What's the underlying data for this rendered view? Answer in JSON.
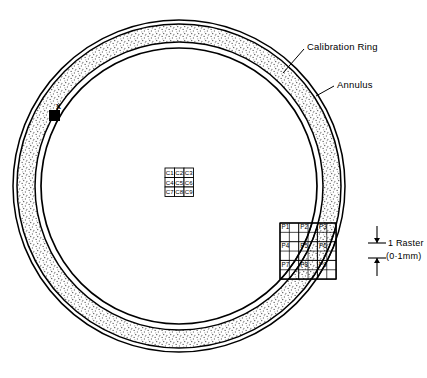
{
  "figure": {
    "type": "technical-line-diagram"
  },
  "geometry": {
    "center_x": 179,
    "center_y": 186,
    "outer_circle_r": 166,
    "annulus_outer_r": 162,
    "annulus_inner_r": 144,
    "calibration_ring_r": 138,
    "stroke_color": "#000000",
    "stipple_color": "#4a4a4a",
    "background": "#ffffff"
  },
  "annotations": {
    "calibration_ring": "Calibration Ring",
    "annulus": "Annulus",
    "marker_x": "x"
  },
  "scale_bar": {
    "line1": "1 Raster",
    "line2": "(0·1mm)"
  },
  "center_grid": {
    "name": "centre-calibration-cells",
    "rows": 3,
    "cols": 3,
    "cells": [
      "C1",
      "C2",
      "C3",
      "C4",
      "C5",
      "C6",
      "C7",
      "C8",
      "C9"
    ],
    "x": 165,
    "y": 168,
    "cell_size": 9.5
  },
  "peripheral_grid": {
    "name": "peripheral-raster-cells",
    "rows": 3,
    "cols": 3,
    "sub_divisions": 6,
    "cells": [
      "P1",
      "P2",
      "P3",
      "P4",
      "P5",
      "P6",
      "P7",
      "P8",
      "P9"
    ],
    "x": 280,
    "y": 223,
    "cell_size": 18.7
  },
  "marker": {
    "name": "reference-marker",
    "x": 49,
    "y": 110,
    "size": 11
  }
}
